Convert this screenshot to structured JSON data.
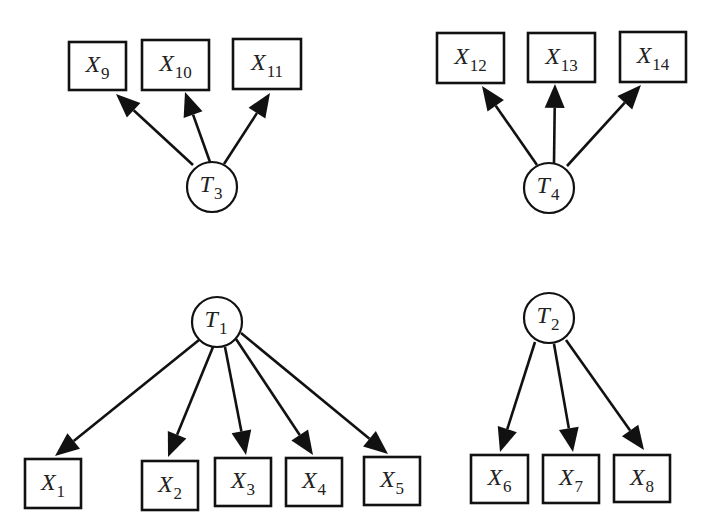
{
  "diagram": {
    "type": "path-diagram",
    "colors": {
      "stroke": "#111111",
      "background": "#ffffff",
      "arrowhead": "#111111"
    },
    "latent_nodes": [
      {
        "id": "T1",
        "base": "T",
        "sub": "1",
        "cx": 217,
        "cy": 322,
        "r": 25
      },
      {
        "id": "T2",
        "base": "T",
        "sub": "2",
        "cx": 549,
        "cy": 318,
        "r": 25
      },
      {
        "id": "T3",
        "base": "T",
        "sub": "3",
        "cx": 212,
        "cy": 187,
        "r": 25
      },
      {
        "id": "T4",
        "base": "T",
        "sub": "4",
        "cx": 549,
        "cy": 188,
        "r": 25
      }
    ],
    "observed_nodes": [
      {
        "id": "X1",
        "base": "X",
        "sub": "1",
        "x": 25,
        "y": 459,
        "w": 56,
        "h": 49
      },
      {
        "id": "X2",
        "base": "X",
        "sub": "2",
        "x": 142,
        "y": 461,
        "w": 56,
        "h": 49
      },
      {
        "id": "X3",
        "base": "X",
        "sub": "3",
        "x": 215,
        "y": 458,
        "w": 56,
        "h": 48
      },
      {
        "id": "X4",
        "base": "X",
        "sub": "4",
        "x": 286,
        "y": 458,
        "w": 56,
        "h": 48
      },
      {
        "id": "X5",
        "base": "X",
        "sub": "5",
        "x": 364,
        "y": 457,
        "w": 56,
        "h": 48
      },
      {
        "id": "X6",
        "base": "X",
        "sub": "6",
        "x": 471,
        "y": 455,
        "w": 57,
        "h": 48
      },
      {
        "id": "X7",
        "base": "X",
        "sub": "7",
        "x": 543,
        "y": 455,
        "w": 56,
        "h": 48
      },
      {
        "id": "X8",
        "base": "X",
        "sub": "8",
        "x": 614,
        "y": 455,
        "w": 56,
        "h": 47
      },
      {
        "id": "X9",
        "base": "X",
        "sub": "9",
        "x": 69,
        "y": 42,
        "w": 57,
        "h": 48
      },
      {
        "id": "X10",
        "base": "X",
        "sub": "10",
        "x": 142,
        "y": 40,
        "w": 67,
        "h": 50
      },
      {
        "id": "X11",
        "base": "X",
        "sub": "11",
        "x": 233,
        "y": 39,
        "w": 68,
        "h": 50
      },
      {
        "id": "X12",
        "base": "X",
        "sub": "12",
        "x": 437,
        "y": 33,
        "w": 67,
        "h": 50
      },
      {
        "id": "X13",
        "base": "X",
        "sub": "13",
        "x": 528,
        "y": 33,
        "w": 67,
        "h": 49
      },
      {
        "id": "X14",
        "base": "X",
        "sub": "14",
        "x": 620,
        "y": 32,
        "w": 66,
        "h": 50
      }
    ],
    "edges": [
      {
        "from": "T1",
        "to": "X1",
        "x1": 199,
        "y1": 340,
        "x2": 55,
        "y2": 456
      },
      {
        "from": "T1",
        "to": "X2",
        "x1": 213,
        "y1": 347,
        "x2": 168,
        "y2": 457
      },
      {
        "from": "T1",
        "to": "X3",
        "x1": 225,
        "y1": 347,
        "x2": 246,
        "y2": 455
      },
      {
        "from": "T1",
        "to": "X4",
        "x1": 236,
        "y1": 339,
        "x2": 313,
        "y2": 455
      },
      {
        "from": "T1",
        "to": "X5",
        "x1": 241,
        "y1": 333,
        "x2": 388,
        "y2": 454
      },
      {
        "from": "T2",
        "to": "X6",
        "x1": 535,
        "y1": 342,
        "x2": 500,
        "y2": 452
      },
      {
        "from": "T2",
        "to": "X7",
        "x1": 554,
        "y1": 344,
        "x2": 573,
        "y2": 452
      },
      {
        "from": "T2",
        "to": "X8",
        "x1": 566,
        "y1": 340,
        "x2": 644,
        "y2": 450
      },
      {
        "from": "T3",
        "to": "X9",
        "x1": 193,
        "y1": 165,
        "x2": 116,
        "y2": 94
      },
      {
        "from": "T3",
        "to": "X10",
        "x1": 210,
        "y1": 162,
        "x2": 185,
        "y2": 92
      },
      {
        "from": "T3",
        "to": "X11",
        "x1": 224,
        "y1": 164,
        "x2": 270,
        "y2": 93
      },
      {
        "from": "T4",
        "to": "X12",
        "x1": 537,
        "y1": 165,
        "x2": 482,
        "y2": 86
      },
      {
        "from": "T4",
        "to": "X13",
        "x1": 554,
        "y1": 163,
        "x2": 555,
        "y2": 84
      },
      {
        "from": "T4",
        "to": "X14",
        "x1": 567,
        "y1": 166,
        "x2": 641,
        "y2": 85
      }
    ]
  }
}
